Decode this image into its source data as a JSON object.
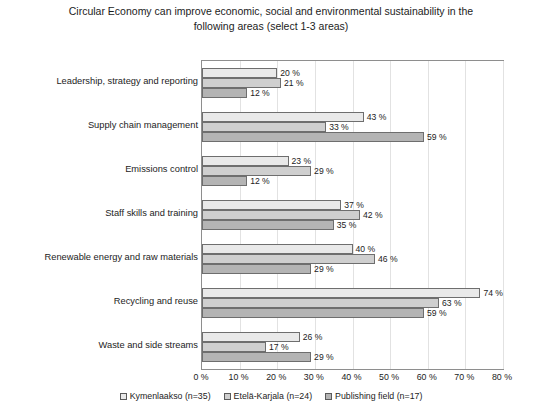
{
  "chart_data": {
    "type": "bar",
    "orientation": "horizontal",
    "title": "Circular Economy can improve economic, social and environmental sustainability in the following areas (select 1-3 areas)",
    "xlabel": "",
    "ylabel": "",
    "xlim": [
      0,
      80
    ],
    "xticks": [
      0,
      10,
      20,
      30,
      40,
      50,
      60,
      70,
      80
    ],
    "xtick_labels": [
      "0 %",
      "10 %",
      "20 %",
      "30 %",
      "40 %",
      "50 %",
      "60 %",
      "70 %",
      "80 %"
    ],
    "grid": true,
    "legend_position": "bottom",
    "value_suffix": " %",
    "categories": [
      "Leadership, strategy and reporting",
      "Supply chain management",
      "Emissions control",
      "Staff skills and training",
      "Renewable energy and raw materials",
      "Recycling and reuse",
      "Waste and side streams"
    ],
    "series": [
      {
        "name": "Kymenlaakso (n=35)",
        "color": "#e9e9e9",
        "values": [
          20,
          43,
          23,
          37,
          40,
          74,
          26
        ],
        "labels": [
          "20 %",
          "43 %",
          "23 %",
          "37 %",
          "40 %",
          "74 %",
          "26 %"
        ]
      },
      {
        "name": "Etelä-Karjala (n=24)",
        "color": "#cfcfcf",
        "values": [
          21,
          33,
          29,
          42,
          46,
          63,
          17
        ],
        "labels": [
          "21 %",
          "33 %",
          "29 %",
          "42 %",
          "46 %",
          "63 %",
          "17 %"
        ]
      },
      {
        "name": "Publishing field (n=17)",
        "color": "#b4b4b4",
        "values": [
          12,
          59,
          12,
          35,
          29,
          59,
          29
        ],
        "labels": [
          "12 %",
          "59 %",
          "12 %",
          "35 %",
          "29 %",
          "59 %",
          "29 %"
        ]
      }
    ]
  }
}
